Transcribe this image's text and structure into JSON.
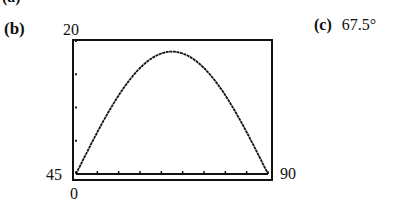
{
  "labels": {
    "part_b": "(b)",
    "part_c": "(c)",
    "answer_c": "67.5°",
    "part_prev": "(a)"
  },
  "axes": {
    "ymax_label": "20",
    "ymin_label": "45",
    "xmin_label": "0",
    "xmax_label": "90"
  },
  "chart_data": {
    "type": "line",
    "title": "",
    "xlabel": "",
    "ylabel": "",
    "xlim": [
      0,
      90
    ],
    "ylim": [
      0,
      20
    ],
    "x_ticks_every": 10,
    "y_ticks_every": 5,
    "grid": false,
    "window_labels": {
      "top": "20",
      "left": "45",
      "bottom": "0",
      "right": "90"
    },
    "series": [
      {
        "name": "curve",
        "x": [
          0,
          10,
          20,
          30,
          40,
          45,
          50,
          60,
          70,
          80,
          90
        ],
        "y": [
          0,
          6.3,
          11.8,
          15.9,
          18.1,
          18.4,
          18.1,
          15.9,
          11.8,
          6.3,
          0
        ]
      }
    ]
  }
}
